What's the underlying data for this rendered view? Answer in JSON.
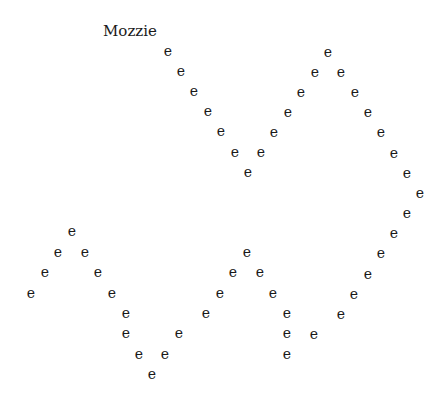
{
  "title": "Mozzie",
  "glyph_char": "e",
  "points": [
    [
      168,
      52
    ],
    [
      181,
      72
    ],
    [
      194,
      92
    ],
    [
      208,
      112
    ],
    [
      221,
      132
    ],
    [
      235,
      153
    ],
    [
      248,
      173
    ],
    [
      261,
      153
    ],
    [
      274,
      133
    ],
    [
      288,
      113
    ],
    [
      301,
      93
    ],
    [
      315,
      73
    ],
    [
      328,
      53
    ],
    [
      341,
      73
    ],
    [
      355,
      93
    ],
    [
      368,
      113
    ],
    [
      381,
      133
    ],
    [
      394,
      154
    ],
    [
      407,
      174
    ],
    [
      420,
      194
    ],
    [
      407,
      214
    ],
    [
      394,
      234
    ],
    [
      381,
      254
    ],
    [
      368,
      275
    ],
    [
      354,
      295
    ],
    [
      341,
      315
    ],
    [
      314,
      335
    ],
    [
      31,
      294
    ],
    [
      45,
      273
    ],
    [
      58,
      253
    ],
    [
      72,
      232
    ],
    [
      85,
      253
    ],
    [
      98,
      273
    ],
    [
      112,
      294
    ],
    [
      126,
      314
    ],
    [
      126,
      334
    ],
    [
      139,
      355
    ],
    [
      152,
      375
    ],
    [
      165,
      355
    ],
    [
      179,
      334
    ],
    [
      206,
      314
    ],
    [
      220,
      294
    ],
    [
      233,
      273
    ],
    [
      247,
      253
    ],
    [
      260,
      273
    ],
    [
      273,
      294
    ],
    [
      287,
      314
    ],
    [
      287,
      334
    ],
    [
      287,
      355
    ]
  ]
}
